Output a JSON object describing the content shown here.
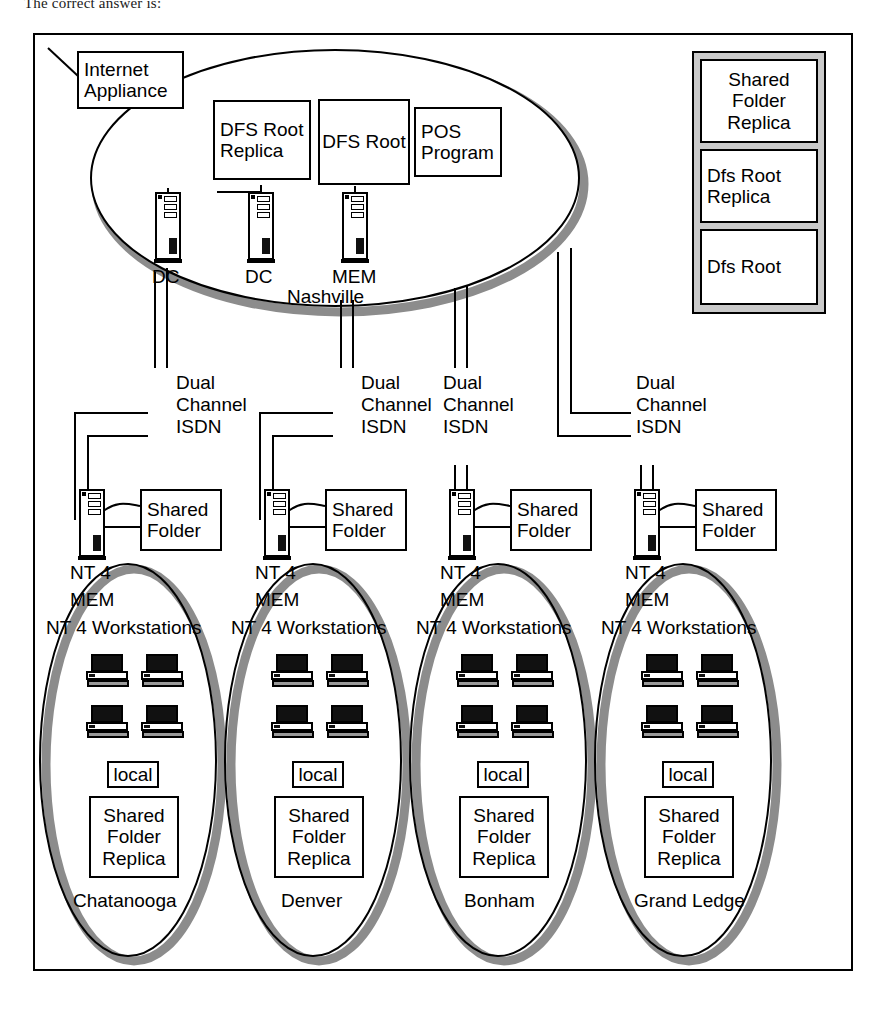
{
  "caption": "The correct answer is:",
  "diagram": {
    "hub": {
      "name": "Nashville",
      "internet_appliance": "Internet Appliance",
      "resources": [
        {
          "id": "dfs-root-replica",
          "label": "DFS Root\nReplica",
          "line1": "DFS Root",
          "line2": "Replica"
        },
        {
          "id": "dfs-root",
          "label": "DFS Root",
          "line1": "DFS Root",
          "line2": ""
        },
        {
          "id": "pos-program",
          "label": "POS Program",
          "line1": "POS",
          "line2": "Program"
        }
      ],
      "servers": [
        {
          "id": "dc-1",
          "label": "DC"
        },
        {
          "id": "dc-2",
          "label": "DC"
        },
        {
          "id": "mem-1",
          "label": "MEM"
        }
      ]
    },
    "legend": {
      "items": [
        {
          "id": "legend-shared-folder-replica",
          "line1": "Shared",
          "line2": "Folder",
          "line3": "Replica"
        },
        {
          "id": "legend-dfs-root-replica",
          "line1": "Dfs Root",
          "line2": "Replica",
          "line3": ""
        },
        {
          "id": "legend-dfs-root",
          "line1": "Dfs Root",
          "line2": "",
          "line3": ""
        }
      ]
    },
    "links": [
      {
        "id": "link-chatanooga",
        "line1": "Dual",
        "line2": "Channel",
        "line3": "ISDN"
      },
      {
        "id": "link-denver",
        "line1": "Dual",
        "line2": "Channel",
        "line3": "ISDN"
      },
      {
        "id": "link-bonham",
        "line1": "Dual",
        "line2": "Channel",
        "line3": "ISDN"
      },
      {
        "id": "link-grand-ledge",
        "line1": "Dual",
        "line2": "Channel",
        "line3": "ISDN"
      }
    ],
    "branch_common": {
      "shared_folder_line1": "Shared",
      "shared_folder_line2": "Folder",
      "server_os": "NT 4",
      "server_role": "MEM",
      "workstations_label": "NT 4 Workstations",
      "local_label": "local",
      "replica_line1": "Shared",
      "replica_line2": "Folder",
      "replica_line3": "Replica",
      "workstation_count": 4
    },
    "branches": [
      {
        "id": "site-chatanooga",
        "name": "Chatanooga"
      },
      {
        "id": "site-denver",
        "name": "Denver"
      },
      {
        "id": "site-bonham",
        "name": "Bonham"
      },
      {
        "id": "site-grand-ledge",
        "name": "Grand Ledge"
      }
    ],
    "colors": {
      "stroke": "#000000",
      "fill": "#ffffff",
      "shadow": "#8c8c8c",
      "legend_bg": "#c9c9c9",
      "screen": "#111111"
    }
  }
}
